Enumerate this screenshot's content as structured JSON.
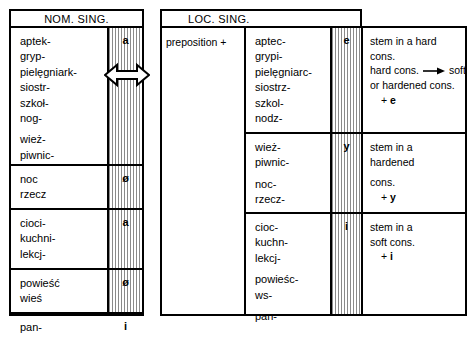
{
  "figure": {
    "type": "grammar-table",
    "language": "Polish",
    "topic": "Nominative singular to Locative singular stem alternation"
  },
  "colors": {
    "ink": "#000000",
    "hatch": "#8a8a8a",
    "paper": "#ffffff"
  },
  "nom": {
    "header": "NOM. SING.",
    "sections": [
      {
        "words": [
          [
            "aptek-",
            "gryp-",
            "pielęgniark-",
            "siostr-",
            "szkoł-",
            "nog-"
          ],
          [
            "wież-",
            "piwnic-"
          ]
        ],
        "ending": "a"
      },
      {
        "words": [
          [
            "noc",
            "rzecz"
          ]
        ],
        "ending": "ø"
      },
      {
        "words": [
          [
            "cioci-",
            "kuchni-",
            "lekcj-"
          ]
        ],
        "ending": "a"
      },
      {
        "words": [
          [
            "powieść",
            "wieś"
          ]
        ],
        "ending": "ø"
      },
      {
        "words": [
          [
            "pan-"
          ]
        ],
        "ending": "i"
      }
    ]
  },
  "loc": {
    "header": "LOC. SING.",
    "preposition": "preposition +",
    "sections": [
      {
        "words": [
          [
            "aptec-",
            "grypi-",
            "pielęgniarc-",
            "siostrz-",
            "szkol-",
            "nodz-"
          ]
        ],
        "ending": "e",
        "rule": {
          "lines": [
            "stem in a hard",
            "cons."
          ],
          "change_before": "hard cons.",
          "change_arrow": "→",
          "change_after": "soft",
          "change_line2": "or hardened cons.",
          "plus": "+ e",
          "plus_bold": "e"
        }
      },
      {
        "words": [
          [
            "wież-",
            "piwnic-"
          ],
          [
            "noc-",
            "rzecz-"
          ]
        ],
        "ending": "y",
        "rule": {
          "lines": [
            "stem in a",
            "hardened"
          ],
          "line3": "cons.",
          "plus": "+ y",
          "plus_bold": "y"
        }
      },
      {
        "words": [
          [
            "cioc-",
            "kuchn-",
            "lekcj-"
          ],
          [
            "powieśc-",
            "ws-"
          ],
          [
            "pan-"
          ]
        ],
        "ending": "i",
        "rule": {
          "lines": [
            "stem in a",
            "soft cons."
          ],
          "plus": "+ i",
          "plus_bold": "i"
        }
      }
    ]
  },
  "icons": {
    "swap_arrow": "double-headed-horizontal-arrow",
    "becomes_arrow": "right-arrow"
  }
}
